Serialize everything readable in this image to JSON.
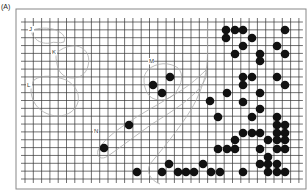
{
  "figure": {
    "panel_label": "(A)",
    "colors": {
      "grid": "#333333",
      "frame": "#888888",
      "dot": "#111111",
      "outline": "#aaaaaa",
      "background": "#ffffff"
    },
    "frame": {
      "x": 16,
      "y": 9,
      "w": 290,
      "h": 180
    },
    "grid": {
      "x0": 25,
      "y0": 22,
      "dx": 8.3,
      "dy": 7.85,
      "cols": 33,
      "rows": 20
    },
    "regions": [
      {
        "label": "J",
        "lx": 29,
        "ly": 31,
        "path": "M33,30 C38,28 48,27 56,30 C62,33 66,36 64,42 C60,44 54,41 50,43 C44,44 38,42 35,38 C32,35 31,33 33,30 Z"
      },
      {
        "label": "K",
        "lx": 52,
        "ly": 54,
        "path": "M58,52 C64,46 76,44 82,48 C88,52 90,58 88,66 C86,74 80,78 72,78 C64,78 58,72 57,64 C56,58 55,55 58,52 Z"
      },
      {
        "label": "L",
        "lx": 27,
        "ly": 87,
        "path": "M34,80 C42,74 56,76 66,80 C74,84 80,92 78,102 C76,110 68,116 58,116 C48,116 38,110 34,102 C30,94 30,86 34,80 Z"
      },
      {
        "label": "M",
        "lx": 149,
        "ly": 63,
        "path": "M148,70 C156,62 170,62 178,68 C184,74 182,84 176,92 C170,100 160,102 152,98 C146,94 144,86 144,80 C144,76 145,73 148,70 Z"
      },
      {
        "label": "N",
        "lx": 94,
        "ly": 133,
        "path": "M98,150 C104,140 114,132 126,124 C140,114 156,106 172,96 C186,88 196,80 206,70 C208,76 204,84 196,92 C184,104 168,114 152,124 C138,134 122,146 108,156 C102,160 96,158 98,150 Z"
      }
    ],
    "boundary_path": "M208,20 C206,40 210,60 204,80 C198,100 190,112 180,126 C170,140 160,152 150,164 C146,172 150,180 160,184"
  },
  "chart_data": {
    "type": "scatter",
    "title": "(A)",
    "xlabel": "",
    "ylabel": "",
    "grid": true,
    "region_labels": [
      "J",
      "K",
      "L",
      "M",
      "N"
    ],
    "points": [
      [
        226,
        30
      ],
      [
        235,
        30
      ],
      [
        243,
        30
      ],
      [
        285,
        30
      ],
      [
        226,
        38
      ],
      [
        252,
        38
      ],
      [
        243,
        46
      ],
      [
        277,
        46
      ],
      [
        235,
        54
      ],
      [
        260,
        54
      ],
      [
        285,
        54
      ],
      [
        260,
        61
      ],
      [
        170,
        77
      ],
      [
        243,
        77
      ],
      [
        252,
        77
      ],
      [
        277,
        77
      ],
      [
        153,
        85
      ],
      [
        243,
        85
      ],
      [
        285,
        85
      ],
      [
        162,
        93
      ],
      [
        227,
        93
      ],
      [
        260,
        93
      ],
      [
        210,
        101
      ],
      [
        243,
        102
      ],
      [
        260,
        109
      ],
      [
        129,
        125
      ],
      [
        218,
        117
      ],
      [
        252,
        117
      ],
      [
        277,
        117
      ],
      [
        277,
        125
      ],
      [
        285,
        125
      ],
      [
        243,
        133
      ],
      [
        252,
        133
      ],
      [
        260,
        133
      ],
      [
        277,
        133
      ],
      [
        285,
        133
      ],
      [
        235,
        140
      ],
      [
        268,
        140
      ],
      [
        277,
        140
      ],
      [
        285,
        140
      ],
      [
        104,
        148
      ],
      [
        218,
        149
      ],
      [
        227,
        149
      ],
      [
        235,
        149
      ],
      [
        260,
        149
      ],
      [
        277,
        149
      ],
      [
        285,
        149
      ],
      [
        268,
        157
      ],
      [
        169,
        164
      ],
      [
        203,
        164
      ],
      [
        260,
        164
      ],
      [
        268,
        164
      ],
      [
        277,
        164
      ],
      [
        137,
        172
      ],
      [
        162,
        172
      ],
      [
        178,
        172
      ],
      [
        186,
        172
      ],
      [
        194,
        172
      ],
      [
        211,
        172
      ],
      [
        220,
        172
      ],
      [
        243,
        172
      ],
      [
        268,
        172
      ],
      [
        277,
        172
      ],
      [
        285,
        172
      ]
    ]
  }
}
